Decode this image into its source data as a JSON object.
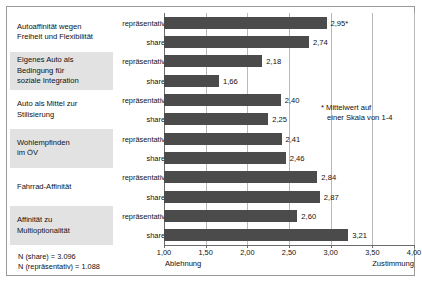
{
  "chart_data": {
    "type": "bar",
    "orientation": "horizontal",
    "title": "",
    "xlabel": "",
    "ylabel": "",
    "xlim": [
      1.0,
      4.0
    ],
    "xticks": [
      "1,00",
      "1,50",
      "2,00",
      "2,50",
      "3,00",
      "3,50",
      "4,00"
    ],
    "xtick_values": [
      1.0,
      1.5,
      2.0,
      2.5,
      3.0,
      3.5,
      4.0
    ],
    "grid": true,
    "legend": "none",
    "bar_color": "#4b4b4b",
    "axis_left_anchor": "Ablehnung",
    "axis_right_anchor": "Zustimmung",
    "categories": [
      "Autoaffinität wegen Freiheit und Flexibilität",
      "Eigenes Auto als Bedingung für soziale Integration",
      "Auto als Mittel zur Stilisierung",
      "Wohlempfinden im ÖV",
      "Fahrrad-Affinität",
      "Affinität zu Multioptionalität"
    ],
    "series": [
      {
        "name": "repräsentativ",
        "values": [
          2.95,
          2.18,
          2.4,
          2.41,
          2.84,
          2.6
        ]
      },
      {
        "name": "share",
        "values": [
          2.74,
          1.66,
          2.25,
          2.46,
          2.87,
          3.21
        ]
      }
    ],
    "bars": [
      {
        "category": "Autoaffinität wegen Freiheit und Flexibilität",
        "series": "repräsentativ",
        "value": 2.95,
        "label": "2,95*"
      },
      {
        "category": "Autoaffinität wegen Freiheit und Flexibilität",
        "series": "share",
        "value": 2.74,
        "label": "2,74"
      },
      {
        "category": "Eigenes Auto als Bedingung für soziale Integration",
        "series": "repräsentativ",
        "value": 2.18,
        "label": "2,18"
      },
      {
        "category": "Eigenes Auto als Bedingung für soziale Integration",
        "series": "share",
        "value": 1.66,
        "label": "1,66"
      },
      {
        "category": "Auto als Mittel zur Stilisierung",
        "series": "repräsentativ",
        "value": 2.4,
        "label": "2,40"
      },
      {
        "category": "Auto als Mittel zur Stilisierung",
        "series": "share",
        "value": 2.25,
        "label": "2,25"
      },
      {
        "category": "Wohlempfinden im ÖV",
        "series": "repräsentativ",
        "value": 2.41,
        "label": "2,41"
      },
      {
        "category": "Wohlempfinden im ÖV",
        "series": "share",
        "value": 2.46,
        "label": "2,46"
      },
      {
        "category": "Fahrrad-Affinität",
        "series": "repräsentativ",
        "value": 2.84,
        "label": "2,84"
      },
      {
        "category": "Fahrrad-Affinität",
        "series": "share",
        "value": 2.87,
        "label": "2,87"
      },
      {
        "category": "Affinität zu Multioptionalität",
        "series": "repräsentativ",
        "value": 2.6,
        "label": "2,60"
      },
      {
        "category": "Affinität zu Multioptionalität",
        "series": "share",
        "value": 3.21,
        "label": "3,21"
      }
    ],
    "annotations": {
      "star_note_line1": "* Mittelwert auf",
      "star_note_line2": "einer Skala von 1-4",
      "n_share": "N (share) = 3.096",
      "n_repraesentativ": "N (repräsentativ) = 1.088"
    }
  },
  "category_labels": [
    {
      "lines": [
        "Autoaffinität wegen",
        "Freiheit und Flexibilität"
      ],
      "shaded": false
    },
    {
      "lines": [
        "Eigenes Auto als",
        "Bedingung für",
        "soziale Integration"
      ],
      "shaded": true
    },
    {
      "lines": [
        "Auto als Mittel zur",
        "Stilisierung"
      ],
      "shaded": false
    },
    {
      "lines": [
        "Wohlempfinden",
        "im ÖV"
      ],
      "shaded": true
    },
    {
      "lines": [
        "Fahrrad-Affinität"
      ],
      "shaded": false
    },
    {
      "lines": [
        "Affinität zu",
        "Multioptionalität"
      ],
      "shaded": true
    }
  ]
}
